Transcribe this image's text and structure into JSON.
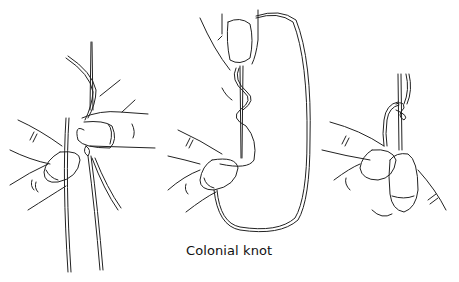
{
  "figure": {
    "caption": "Colonial knot",
    "panels": [
      {
        "step": 1,
        "description": "thread wrapped around needle held between fingers"
      },
      {
        "step": 2,
        "description": "thread looped in figure-eight around needle, held by thumb"
      },
      {
        "step": 3,
        "description": "completed knot on needle held between fingers"
      }
    ],
    "line_color": "#222222",
    "background": "#ffffff"
  }
}
